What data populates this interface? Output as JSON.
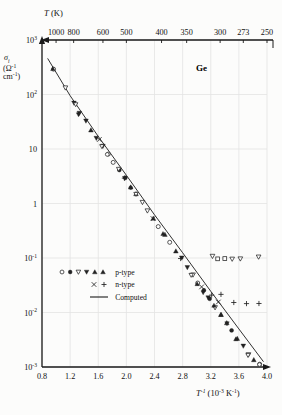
{
  "figure": {
    "material_label": "Ge",
    "background_color": "#ffffff",
    "grid_color": "#e3e3e3",
    "axis_color": "#1a1a1a",
    "marker_color": "#222222"
  },
  "chart_data": {
    "type": "scatter",
    "title": "",
    "subtitle": "",
    "material": "Ge",
    "xlabel": "T⁻¹ (10⁻³ K⁻¹)",
    "ylabel": "σᵢ (Ω⁻¹ cm⁻¹)",
    "ylabel_symbol": "σᵢ",
    "ylabel_units": "(Ω⁻¹ cm⁻¹)",
    "top_axis_label": "T (K)",
    "xlim": [
      0.8,
      4.0
    ],
    "ylim": [
      0.001,
      1000
    ],
    "yscale": "log",
    "xscale": "linear",
    "grid": true,
    "legend_position": "lower-left",
    "x_ticks": [
      "0.8",
      "1.2",
      "1.6",
      "2.0",
      "2.4",
      "2.8",
      "3.2",
      "3.6",
      "4.0"
    ],
    "x_tick_values": [
      0.8,
      1.2,
      1.6,
      2.0,
      2.4,
      2.8,
      3.2,
      3.6,
      4.0
    ],
    "y_ticks": [
      "10³",
      "10²",
      "10",
      "1",
      "10⁻¹",
      "10⁻²",
      "10⁻³"
    ],
    "y_tick_values": [
      1000,
      100,
      10,
      1,
      0.1,
      0.01,
      0.001
    ],
    "top_ticks": [
      "1000",
      "800",
      "600",
      "500",
      "400",
      "350",
      "300",
      "273",
      "250"
    ],
    "top_tick_values": [
      1000,
      800,
      600,
      500,
      400,
      350,
      300,
      273,
      250
    ],
    "legend": [
      {
        "label": "p-type",
        "markers": [
          "circle-open",
          "circle-filled",
          "triangle-down-open",
          "triangle-down-filled",
          "triangle-up-filled",
          "triangle-up-filled"
        ]
      },
      {
        "label": "n-type",
        "markers": [
          "cross-x",
          "plus"
        ]
      },
      {
        "label": "Computed",
        "markers": [
          "line"
        ]
      }
    ],
    "computed_line": {
      "name": "Computed",
      "x": [
        0.88,
        1.2,
        1.6,
        2.0,
        2.4,
        2.8,
        3.2,
        3.6,
        3.95
      ],
      "y": [
        460,
        95,
        17.0,
        3.3,
        0.62,
        0.125,
        0.0245,
        0.005,
        0.00125
      ]
    },
    "series": [
      {
        "name": "p-type",
        "marker": "mixed",
        "x": [
          0.97,
          1.13,
          1.26,
          1.34,
          1.42,
          1.5,
          1.58,
          1.66,
          1.74,
          1.82,
          1.9,
          1.98,
          2.06,
          2.14,
          2.22,
          2.3,
          2.38,
          2.46,
          2.54,
          2.62,
          2.7,
          2.78,
          2.86,
          2.94,
          3.02,
          3.1,
          3.18,
          3.26,
          3.34,
          3.42,
          3.5,
          3.58,
          3.66,
          3.74,
          3.82,
          3.9
        ],
        "y": [
          300,
          130,
          68,
          46,
          32,
          22.5,
          16.0,
          11.2,
          8.0,
          5.7,
          4.0,
          2.9,
          2.05,
          1.45,
          1.05,
          0.74,
          0.53,
          0.38,
          0.27,
          0.19,
          0.135,
          0.097,
          0.069,
          0.049,
          0.035,
          0.025,
          0.0178,
          0.0127,
          0.0091,
          0.0065,
          0.0046,
          0.0033,
          0.0024,
          0.0017,
          0.00135,
          0.0011
        ]
      },
      {
        "name": "n-type",
        "marker": "cross-plus",
        "x": [
          1.62,
          1.98,
          2.38,
          2.78,
          3.06,
          3.22,
          3.3
        ],
        "y": [
          15.0,
          2.95,
          0.52,
          0.095,
          0.03,
          0.0205,
          0.016
        ]
      },
      {
        "name": "p-type-outliers",
        "marker": "triangle-open",
        "x": [
          3.22,
          3.3,
          3.4,
          3.5,
          3.62,
          3.88
        ],
        "y": [
          0.105,
          0.098,
          0.1,
          0.098,
          0.1,
          0.105
        ]
      },
      {
        "name": "n-type-outliers",
        "marker": "plus",
        "x": [
          3.34,
          3.53,
          3.7,
          3.88
        ],
        "y": [
          0.0215,
          0.015,
          0.015,
          0.015
        ]
      }
    ]
  }
}
